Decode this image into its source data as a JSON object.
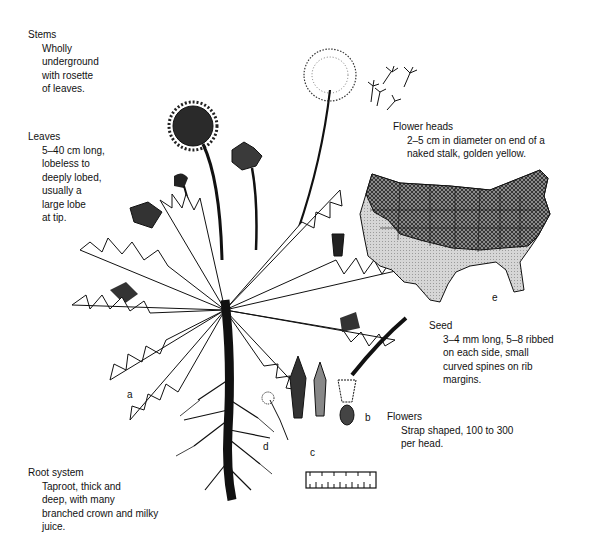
{
  "annotations": {
    "stems": {
      "title": "Stems",
      "lines": [
        "Wholly",
        "underground",
        "with rosette",
        "of leaves."
      ]
    },
    "leaves": {
      "title": "Leaves",
      "lines": [
        "5–40 cm long,",
        "lobeless to",
        "deeply lobed,",
        "usually a",
        "large lobe",
        "at tip."
      ]
    },
    "flower_heads": {
      "title": "Flower heads",
      "lines": [
        "2–5 cm in diameter on end of a",
        "naked stalk, golden yellow."
      ]
    },
    "seed": {
      "title": "Seed",
      "lines": [
        "3–4 mm long, 5–8 ribbed",
        "on each side, small",
        "curved spines on rib",
        "margins."
      ]
    },
    "flowers": {
      "title": "Flowers",
      "lines": [
        "Strap shaped, 100 to 300",
        "per head."
      ]
    },
    "root_system": {
      "title": "Root system",
      "lines": [
        "Taproot, thick and",
        "deep, with many",
        "branched crown and milky",
        "juice."
      ]
    }
  },
  "part_labels": {
    "a": "a",
    "b": "b",
    "c": "c",
    "d": "d",
    "e": "e"
  },
  "colors": {
    "ink": "#111111",
    "map_dense": "#6e6e6e",
    "map_light": "#c8c8c8",
    "map_blank": "#f2f2f2"
  }
}
